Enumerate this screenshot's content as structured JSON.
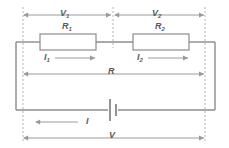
{
  "diagram": {
    "colors": {
      "wire": "#8c8c8c",
      "arrow": "#9a9a9a",
      "dashed": "#b4b4b4",
      "resistor_border": "#8c8c8c",
      "resistor_fill": "#ffffff",
      "battery": "#7a7a7a",
      "text": "#5a5a5a",
      "background": "#ffffff"
    },
    "labels": {
      "v1": "V",
      "v1_sub": "1",
      "v2": "V",
      "v2_sub": "2",
      "r1": "R",
      "r1_sub": "1",
      "r2": "R",
      "r2_sub": "2",
      "i1": "I",
      "i1_sub": "1",
      "i2": "I",
      "i2_sub": "2",
      "r_total": "R",
      "i_total": "I",
      "v_total": "V"
    },
    "components": [
      {
        "name": "resistor-r1",
        "label": "R1"
      },
      {
        "name": "resistor-r2",
        "label": "R2"
      },
      {
        "name": "battery",
        "label": "battery"
      }
    ],
    "dimension_arrows": [
      {
        "name": "v1-dimension",
        "label": "V1",
        "style": "double-headed"
      },
      {
        "name": "v2-dimension",
        "label": "V2",
        "style": "double-headed"
      },
      {
        "name": "r-dimension",
        "label": "R",
        "style": "double-headed"
      },
      {
        "name": "v-dimension",
        "label": "V",
        "style": "double-headed"
      }
    ],
    "current_arrows": [
      {
        "name": "i1-current",
        "label": "I1",
        "direction": "right"
      },
      {
        "name": "i2-current",
        "label": "I2",
        "direction": "right"
      },
      {
        "name": "i-current",
        "label": "I",
        "direction": "left"
      }
    ]
  }
}
